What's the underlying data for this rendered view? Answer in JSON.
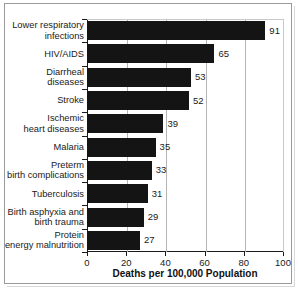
{
  "chart_data": {
    "type": "bar",
    "orientation": "horizontal",
    "title": "",
    "xlabel": "Deaths per 100,000 Population",
    "ylabel": "",
    "xlim": [
      0,
      100
    ],
    "xticks": [
      0,
      20,
      40,
      60,
      80,
      100
    ],
    "grid": "vertical",
    "legend": "none",
    "bar_color": "#141414",
    "categories": [
      "Lower respiratory\ninfections",
      "HIV/AIDS",
      "Diarrheal\ndiseases",
      "Stroke",
      "Ischemic\nheart diseases",
      "Malaria",
      "Preterm\nbirth complications",
      "Tuberculosis",
      "Birth asphyxia and\nbirth trauma",
      "Protein\nenergy malnutrition"
    ],
    "values": [
      91,
      65,
      53,
      52,
      39,
      35,
      33,
      31,
      29,
      27
    ],
    "data_labels": [
      "91",
      "65",
      "53",
      "52",
      "39",
      "35",
      "33",
      "31",
      "29",
      "27"
    ]
  }
}
